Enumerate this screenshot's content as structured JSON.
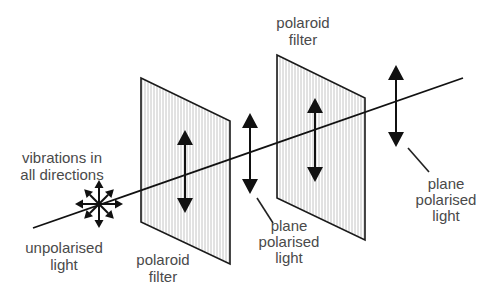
{
  "colors": {
    "line": "#111111",
    "text": "#4a4a4a",
    "filter_hatch": "#bdbdbd",
    "background": "#ffffff"
  },
  "labels": {
    "source_top": [
      "vibrations in",
      "all directions"
    ],
    "source_bottom": [
      "unpolarised",
      "light"
    ],
    "filter1": [
      "polaroid",
      "filter"
    ],
    "filter2": [
      "polaroid",
      "filter"
    ],
    "between": [
      "plane",
      "polarised",
      "light"
    ],
    "output": [
      "plane",
      "polarised",
      "light"
    ]
  },
  "elements": {
    "source": "unpolarised light source with vibrations in all directions",
    "filter_count": 2,
    "vibration_orientation": "vertical"
  }
}
